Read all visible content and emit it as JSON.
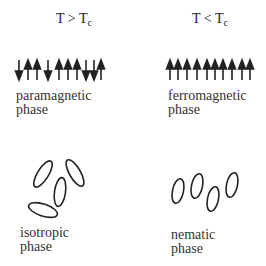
{
  "panels": [
    {
      "id": "paramagnetic",
      "header": {
        "main": "T > T",
        "sub": "c"
      },
      "label_line1": "paramagnetic",
      "label_line2": "phase",
      "spins": [
        "down",
        "up",
        "up",
        "down",
        "up",
        "up",
        "up",
        "down",
        "down",
        "up"
      ]
    },
    {
      "id": "ferromagnetic",
      "header": {
        "main": "T < T",
        "sub": "c"
      },
      "label_line1": "ferromagnetic",
      "label_line2": "phase",
      "spins": [
        "up",
        "up",
        "up",
        "up",
        "up",
        "up",
        "up",
        "up",
        "up",
        "up"
      ]
    },
    {
      "id": "isotropic",
      "label_line1": "isotropic",
      "label_line2": "phase",
      "molecules": 4,
      "orientation": "random"
    },
    {
      "id": "nematic",
      "label_line1": "nematic",
      "label_line2": "phase",
      "molecules": 4,
      "orientation": "aligned"
    }
  ],
  "colors": {
    "ink": "#222222",
    "background": "#ffffff"
  }
}
